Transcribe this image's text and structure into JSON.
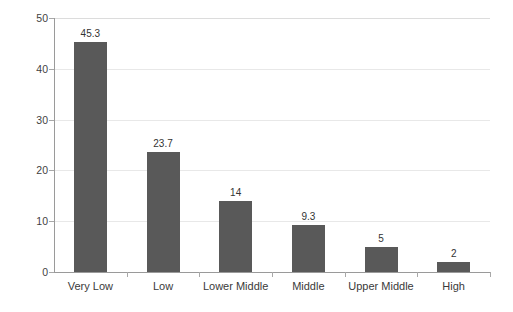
{
  "chart_data": {
    "type": "bar",
    "title": "",
    "subtitle": "",
    "xlabel": "",
    "ylabel": "",
    "categories": [
      "Very Low",
      "Low",
      "Lower Middle",
      "Middle",
      "Upper Middle",
      "High"
    ],
    "values": [
      45.3,
      23.7,
      14,
      9.3,
      5,
      2
    ],
    "value_labels": [
      "45.3",
      "23.7",
      "14",
      "9.3",
      "5",
      "2"
    ],
    "ylim": [
      0,
      50
    ],
    "yticks": [
      0,
      10,
      20,
      30,
      40,
      50
    ],
    "ytick_labels": [
      "0",
      "10",
      "20",
      "30",
      "40",
      "50"
    ],
    "grid": true,
    "grid_axis": "y",
    "legend": false,
    "legend_position": "none",
    "series": [
      {
        "name": "",
        "values": [
          45.3,
          23.7,
          14,
          9.3,
          5,
          2
        ],
        "color": "#595959"
      }
    ],
    "colors": {
      "bar": "#595959",
      "gridline": "#e8e8e8",
      "axis": "#9a9a9a",
      "text": "#3a3a3a",
      "background": "#ffffff"
    }
  }
}
